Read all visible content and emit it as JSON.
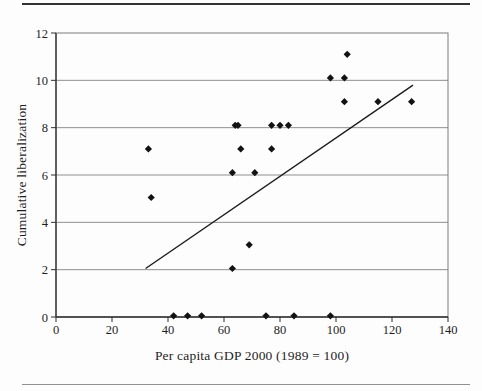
{
  "figure": {
    "background": "#fdfdfd",
    "top_rule_color": "#333333",
    "bottom_rule_color": "#919191"
  },
  "chart_data": {
    "type": "scatter",
    "title": "",
    "xlabel": "Per capita GDP 2000 (1989 = 100)",
    "ylabel": "Cumulative liberalization",
    "xlim": [
      0,
      140
    ],
    "ylim": [
      0,
      12
    ],
    "x_ticks": [
      0,
      20,
      40,
      60,
      80,
      100,
      120,
      140
    ],
    "y_ticks": [
      0,
      2,
      4,
      6,
      8,
      10,
      12
    ],
    "grid": "horizontal",
    "legend": "none",
    "marker": "diamond",
    "marker_size": 3.6,
    "marker_color": "#121212",
    "gridline_color": "#8f8f8f",
    "border_color": "#7c7c7c",
    "axis_color": "#2f2f2f",
    "tick_label_color": "#1e1e1e",
    "points": [
      [
        42,
        0.05
      ],
      [
        47,
        0.05
      ],
      [
        52,
        0.05
      ],
      [
        75,
        0.05
      ],
      [
        85,
        0.05
      ],
      [
        98,
        0.05
      ],
      [
        63,
        2.05
      ],
      [
        69,
        3.05
      ],
      [
        34,
        5.05
      ],
      [
        63,
        6.1
      ],
      [
        71,
        6.1
      ],
      [
        33,
        7.1
      ],
      [
        66,
        7.1
      ],
      [
        77,
        7.1
      ],
      [
        64,
        8.1
      ],
      [
        65,
        8.1
      ],
      [
        77,
        8.1
      ],
      [
        80,
        8.1
      ],
      [
        83,
        8.1
      ],
      [
        103,
        9.1
      ],
      [
        115,
        9.1
      ],
      [
        127,
        9.1
      ],
      [
        98,
        10.1
      ],
      [
        103,
        10.1
      ],
      [
        104,
        11.1
      ]
    ],
    "trend_line": {
      "x1": 32,
      "y1": 2.05,
      "x2": 127.5,
      "y2": 9.8,
      "color": "#1c1c1c"
    }
  }
}
